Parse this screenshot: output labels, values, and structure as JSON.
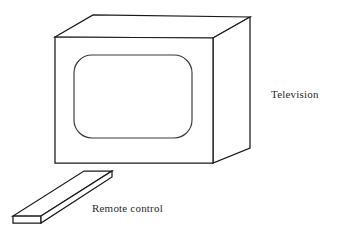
{
  "diagram": {
    "background_color": "#ffffff",
    "line_color": "#1a1a1a",
    "text_color": "#2b2b2b",
    "labels": {
      "television": "Television",
      "remote_control": "Remote control"
    },
    "objects": [
      {
        "name": "television",
        "description": "Three-dimensional box drawn in oblique projection with a rounded rectangular screen on the front face",
        "faces": [
          "front",
          "top",
          "right-side"
        ],
        "screen": {
          "shape": "rounded-rectangle",
          "corner_radius": 18
        }
      },
      {
        "name": "remote-control",
        "description": "Thin flat slab drawn as a parallelogram with visible edge thickness, lying in front of and to the left of the television"
      }
    ]
  }
}
